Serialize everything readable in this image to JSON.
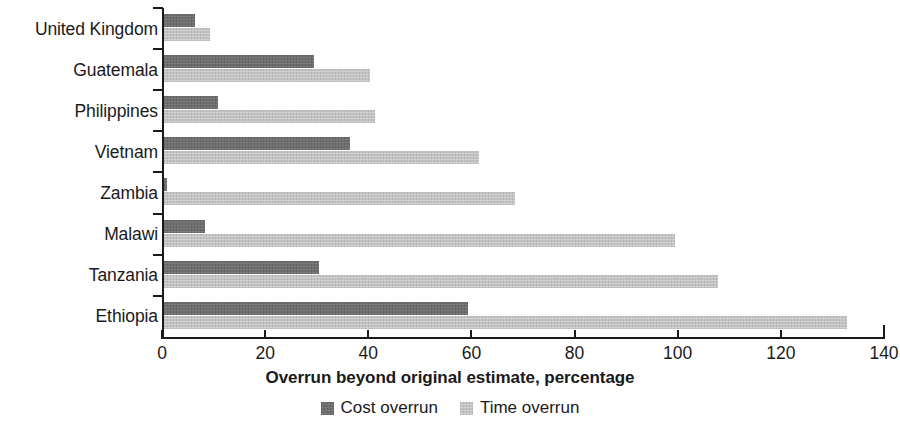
{
  "chart_data": {
    "type": "bar",
    "orientation": "horizontal",
    "title": "",
    "xlabel": "Overrun beyond original estimate, percentage",
    "ylabel": "",
    "xlim": [
      0,
      140
    ],
    "xticks": [
      0,
      20,
      40,
      60,
      80,
      100,
      120,
      140
    ],
    "xtick_labels": [
      "0",
      "20",
      "40",
      "60",
      "80",
      "100",
      "120",
      "140"
    ],
    "grid": false,
    "legend_position": "bottom",
    "categories": [
      "United Kingdom",
      "Guatemala",
      "Philippines",
      "Vietnam",
      "Zambia",
      "Malawi",
      "Tanzania",
      "Ethiopia"
    ],
    "series": [
      {
        "name": "Cost overrun",
        "color": "#6e6e6e",
        "values": [
          6,
          29,
          10.5,
          36,
          0.5,
          8,
          30,
          59
        ]
      },
      {
        "name": "Time overrun",
        "color": "#c3c3c3",
        "values": [
          9,
          40,
          41,
          61,
          68,
          99,
          107.5,
          132.5
        ]
      }
    ]
  },
  "axis": {
    "title": "Overrun beyond original estimate, percentage"
  },
  "legend": {
    "items": [
      {
        "label": "Cost overrun",
        "swatch": "cost-overrun-swatch"
      },
      {
        "label": "Time overrun",
        "swatch": "time-overrun-swatch"
      }
    ]
  }
}
